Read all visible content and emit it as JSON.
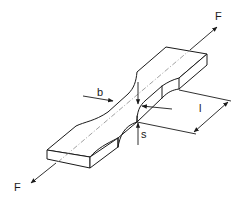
{
  "diagram": {
    "labels": {
      "force_top": "F",
      "force_bottom": "F",
      "width": "b",
      "thickness": "s",
      "length": "l"
    },
    "colors": {
      "line": "#1a1a1a",
      "centerline": "#777777",
      "background": "#ffffff"
    }
  }
}
